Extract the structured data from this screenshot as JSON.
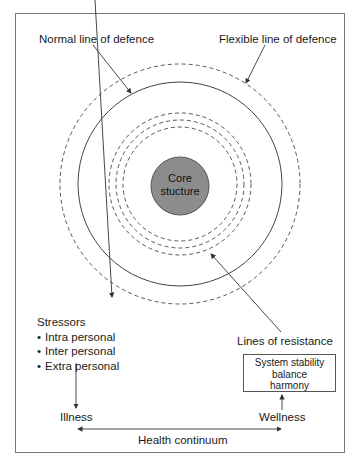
{
  "diagram": {
    "labels": {
      "normal_line": "Normal line of defence",
      "flexible_line": "Flexible line of defence",
      "core_line1": "Core",
      "core_line2": "stucture",
      "lines_of_resistance": "Lines of resistance",
      "illness": "Illness",
      "wellness": "Wellness",
      "health_continuum": "Health continuum"
    },
    "stressors": {
      "title": "Stressors",
      "items": [
        "Intra personal",
        "Inter personal",
        "Extra personal"
      ]
    },
    "stability_box": {
      "lines": [
        "System stability",
        "balance",
        "harmony"
      ]
    },
    "colors": {
      "core_fill": "#8c8c8c",
      "line": "#444444",
      "frame": "#777777"
    }
  }
}
